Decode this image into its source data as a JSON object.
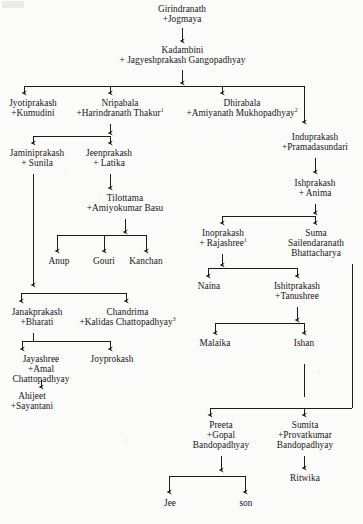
{
  "diagram": {
    "type": "genealogy-family-tree",
    "title": "",
    "line_color": "#1c1c1e",
    "background_color": "#fbfbf9",
    "text_color": "#17171a",
    "footnote_markers": [
      "1",
      "2",
      "3"
    ],
    "nodes": [
      {
        "id": "girindranath",
        "lines": [
          "Girindranath",
          "+Jogmaya"
        ],
        "sup": "",
        "x": 137,
        "y": 4,
        "w": 90
      },
      {
        "id": "kadambini",
        "lines": [
          "Kadambini",
          "+ Jagyeshprakash Gangopadhyay"
        ],
        "sup": "",
        "x": 100,
        "y": 45,
        "w": 165
      },
      {
        "id": "jyotiprakash",
        "lines": [
          "Jyotiprakash",
          "+Kumudini"
        ],
        "sup": "",
        "x": 1,
        "y": 98,
        "w": 64
      },
      {
        "id": "nripabala",
        "lines": [
          "Nripabala",
          "+Harindranath Thakur"
        ],
        "sup": "1",
        "x": 65,
        "y": 98,
        "w": 110
      },
      {
        "id": "dhirabala",
        "lines": [
          "Dhirabala",
          "+Amiyanath Mukhopadhyay"
        ],
        "sup": "2",
        "x": 176,
        "y": 98,
        "w": 132
      },
      {
        "id": "induprakash",
        "lines": [
          "Induprakash",
          "+Pramadasundari"
        ],
        "sup": "",
        "x": 272,
        "y": 132,
        "w": 86
      },
      {
        "id": "jaminiprakash",
        "lines": [
          "Jaminiprakash",
          "+ Sunila"
        ],
        "sup": "",
        "x": 0,
        "y": 148,
        "w": 74
      },
      {
        "id": "jeenprakash",
        "lines": [
          "Jeenprakash",
          "+ Latika"
        ],
        "sup": "",
        "x": 76,
        "y": 148,
        "w": 66
      },
      {
        "id": "ishprakash",
        "lines": [
          "Ishprakash",
          "+ Anima"
        ],
        "sup": "",
        "x": 276,
        "y": 178,
        "w": 78
      },
      {
        "id": "tilottama",
        "lines": [
          "Tilottama",
          "+Amiyokumar Basu"
        ],
        "sup": "",
        "x": 78,
        "y": 193,
        "w": 94
      },
      {
        "id": "inoprakash",
        "lines": [
          "Inoprakash",
          "+ Rajashree"
        ],
        "sup": "1",
        "x": 190,
        "y": 228,
        "w": 66
      },
      {
        "id": "suma",
        "lines": [
          "Suma",
          "Sailendaranath",
          "Bhattacharya"
        ],
        "sup": "",
        "x": 280,
        "y": 228,
        "w": 72
      },
      {
        "id": "anup",
        "lines": [
          "Anup"
        ],
        "sup": "",
        "x": 44,
        "y": 256,
        "w": 30
      },
      {
        "id": "gouri",
        "lines": [
          "Gouri"
        ],
        "sup": "",
        "x": 89,
        "y": 256,
        "w": 30
      },
      {
        "id": "kanchan",
        "lines": [
          "Kanchan"
        ],
        "sup": "",
        "x": 125,
        "y": 256,
        "w": 42
      },
      {
        "id": "naina",
        "lines": [
          "Naina"
        ],
        "sup": "",
        "x": 192,
        "y": 281,
        "w": 34
      },
      {
        "id": "ishitprakash",
        "lines": [
          "Ishitprakash",
          "+Tanushree"
        ],
        "sup": "",
        "x": 263,
        "y": 281,
        "w": 68
      },
      {
        "id": "janakprakash",
        "lines": [
          "Janakprakash",
          "+Bharati"
        ],
        "sup": "",
        "x": 1,
        "y": 307,
        "w": 72
      },
      {
        "id": "chandrima",
        "lines": [
          "Chandrima",
          "+Kalidas Chattopadhyay"
        ],
        "sup": "3",
        "x": 70,
        "y": 307,
        "w": 115
      },
      {
        "id": "malaika",
        "lines": [
          "Malaika"
        ],
        "sup": "",
        "x": 196,
        "y": 338,
        "w": 38
      },
      {
        "id": "ishan",
        "lines": [
          "Ishan"
        ],
        "sup": "",
        "x": 288,
        "y": 338,
        "w": 32
      },
      {
        "id": "jayashree",
        "lines": [
          "Jayashree",
          "+Amal",
          "Chattopadhyay"
        ],
        "sup": "",
        "x": 2,
        "y": 354,
        "w": 78
      },
      {
        "id": "joyprokash",
        "lines": [
          "Joyprokash"
        ],
        "sup": "",
        "x": 84,
        "y": 354,
        "w": 56
      },
      {
        "id": "ahijeet",
        "lines": [
          "Ahijeet",
          "+Sayantani"
        ],
        "sup": "",
        "x": 4,
        "y": 391,
        "w": 56
      },
      {
        "id": "preeta",
        "lines": [
          "Preeta",
          "+Gopal",
          "Bandopadhyay"
        ],
        "sup": "",
        "x": 185,
        "y": 420,
        "w": 72
      },
      {
        "id": "sumita",
        "lines": [
          "Sumita",
          "+Provatkumar",
          "Bandopadhyay"
        ],
        "sup": "",
        "x": 266,
        "y": 420,
        "w": 78
      },
      {
        "id": "ritwika",
        "lines": [
          "Ritwika"
        ],
        "sup": "",
        "x": 285,
        "y": 473,
        "w": 40
      },
      {
        "id": "jee",
        "lines": [
          "Jee"
        ],
        "sup": "",
        "x": 159,
        "y": 498,
        "w": 22
      },
      {
        "id": "son",
        "lines": [
          "son"
        ],
        "sup": "",
        "x": 234,
        "y": 498,
        "w": 24
      }
    ],
    "connectors": {
      "description": "Arrowed descent lines linking generations",
      "count": 24
    }
  }
}
